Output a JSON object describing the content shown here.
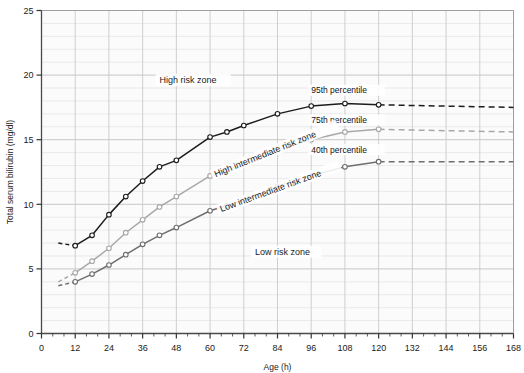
{
  "chart_data": {
    "type": "line",
    "title": "",
    "xlabel": "Age (h)",
    "ylabel": "Total serum bilirubin (mg/dl)",
    "xlim": [
      0,
      168
    ],
    "ylim": [
      0,
      25
    ],
    "xticks": [
      0,
      12,
      24,
      36,
      48,
      60,
      72,
      84,
      96,
      108,
      120,
      132,
      144,
      156,
      168
    ],
    "xtick_labels": [
      "0",
      "12",
      "24",
      "36",
      "48",
      "60",
      "72",
      "84",
      "96",
      "108",
      "120",
      "132",
      "144",
      "156",
      "168"
    ],
    "yticks": [
      0,
      5,
      10,
      15,
      20,
      25
    ],
    "ytick_labels": [
      "0",
      "5",
      "10",
      "15",
      "20",
      "25"
    ],
    "x_minor_step": 4,
    "y_minor_step": 1,
    "grid": true,
    "grid_color": "#d8d8d8",
    "plot_bg": "#fbfbfb",
    "legend_position": "inline-on-curve",
    "series": [
      {
        "name": "95th percentile",
        "color": "#1c1c1c",
        "marker": "open-circle",
        "label_x": 96,
        "label_y": 18.6,
        "x": [
          12,
          18,
          24,
          30,
          36,
          42,
          48,
          60,
          66,
          72,
          84,
          96,
          108,
          120
        ],
        "y": [
          6.8,
          7.6,
          9.2,
          10.6,
          11.8,
          12.9,
          13.4,
          15.2,
          15.6,
          16.1,
          17.0,
          17.6,
          17.8,
          17.7
        ],
        "dashed_lead": {
          "x": [
            6,
            12
          ],
          "y": [
            7.0,
            6.8
          ]
        },
        "dashed_tail": {
          "x": [
            120,
            168
          ],
          "y": [
            17.7,
            17.5
          ]
        }
      },
      {
        "name": "75th percentile",
        "color": "#a8a8a8",
        "marker": "open-circle",
        "label_x": 96,
        "label_y": 16.3,
        "x": [
          12,
          18,
          24,
          30,
          36,
          42,
          48,
          60,
          66,
          72,
          84,
          96,
          108,
          120
        ],
        "y": [
          4.7,
          5.6,
          6.6,
          7.8,
          8.8,
          9.8,
          10.6,
          12.2,
          12.6,
          13.1,
          14.2,
          15.0,
          15.6,
          15.8
        ],
        "dashed_lead": {
          "x": [
            6,
            12
          ],
          "y": [
            4.0,
            4.7
          ]
        },
        "dashed_tail": {
          "x": [
            120,
            168
          ],
          "y": [
            15.8,
            15.6
          ]
        }
      },
      {
        "name": "40th percentile",
        "color": "#6e6e6e",
        "marker": "open-circle",
        "label_x": 96,
        "label_y": 14.0,
        "x": [
          12,
          18,
          24,
          30,
          36,
          42,
          48,
          60,
          66,
          72,
          84,
          96,
          108,
          120
        ],
        "y": [
          4.0,
          4.6,
          5.3,
          6.1,
          6.9,
          7.6,
          8.2,
          9.5,
          9.9,
          10.3,
          11.4,
          12.2,
          12.9,
          13.3
        ],
        "dashed_lead": {
          "x": [
            6,
            12
          ],
          "y": [
            3.7,
            4.0
          ]
        },
        "dashed_tail": {
          "x": [
            120,
            168
          ],
          "y": [
            13.3,
            13.3
          ]
        }
      }
    ],
    "annotations": [
      {
        "text": "High risk zone",
        "x": 42,
        "y": 19.4,
        "rotation": 0,
        "name": "high-risk-zone-label"
      },
      {
        "text": "High intermediate risk zone",
        "x": 62,
        "y": 12.1,
        "rotation": -22,
        "name": "high-intermediate-risk-zone-label"
      },
      {
        "text": "Low intermediate risk zone",
        "x": 64,
        "y": 9.4,
        "rotation": -20,
        "name": "low-intermediate-risk-zone-label"
      },
      {
        "text": "Low risk zone",
        "x": 76,
        "y": 6.1,
        "rotation": 0,
        "name": "low-risk-zone-label"
      }
    ]
  }
}
